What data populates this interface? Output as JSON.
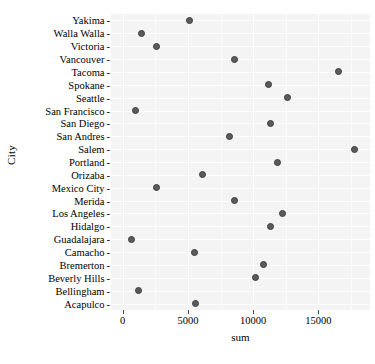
{
  "chart_data": {
    "type": "scatter",
    "title": "",
    "xlabel": "sum",
    "ylabel": "City",
    "xlim": [
      -900,
      18950
    ],
    "xticks": [
      0,
      5000,
      10000,
      15000
    ],
    "xtick_labels": [
      "0",
      "5000",
      "10000",
      "15000"
    ],
    "grid": true,
    "legend": null,
    "orientation": "horizontal",
    "categories": [
      "Yakima",
      "Walla Walla",
      "Victoria",
      "Vancouver",
      "Tacoma",
      "Spokane",
      "Seattle",
      "San Francisco",
      "San Diego",
      "San Andres",
      "Salem",
      "Portland",
      "Orizaba",
      "Mexico City",
      "Merida",
      "Los Angeles",
      "Hidalgo",
      "Guadalajara",
      "Camacho",
      "Bremerton",
      "Beverly Hills",
      "Bellingham",
      "Acapulco"
    ],
    "values": [
      5150,
      1450,
      2600,
      8550,
      16500,
      11150,
      12650,
      950,
      11300,
      8150,
      17800,
      11850,
      6150,
      2600,
      8550,
      12250,
      11300,
      650,
      5500,
      10800,
      10200,
      1200,
      5550
    ],
    "point_color": "#5b5b5b",
    "point_edge_color": "#3d3d3d",
    "panel_background": "#f4f4f4",
    "grid_color": "#ffffff"
  }
}
